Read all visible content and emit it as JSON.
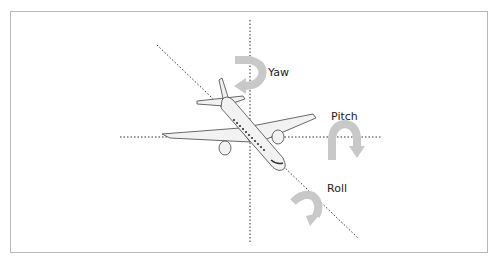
{
  "diagram": {
    "labels": {
      "yaw": "Yaw",
      "pitch": "Pitch",
      "roll": "Roll"
    },
    "colors": {
      "axis_line": "#333333",
      "arrow": "#c8c8c8",
      "aircraft_body": "#f2f2f2",
      "aircraft_outline": "#444444",
      "frame_border": "#b8b8b8"
    }
  }
}
